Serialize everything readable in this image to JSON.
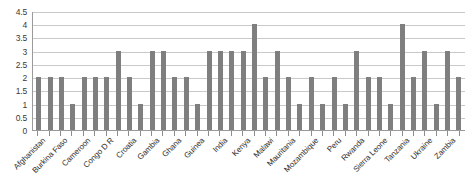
{
  "chart_data": {
    "type": "bar",
    "title": "",
    "subtitle": "",
    "xlabel": "",
    "ylabel": "",
    "ylim": [
      0,
      4.5
    ],
    "grid": true,
    "legend": false,
    "legend_position": "none",
    "bar_color": "#7f7f7f",
    "gridline_color": "#c9c9c9",
    "axis_color": "#9a9a9a",
    "y_ticks": [
      0,
      0.5,
      1,
      1.5,
      2,
      2.5,
      3,
      3.5,
      4,
      4.5
    ],
    "y_tick_labels": [
      "0",
      "0.5",
      "1",
      "1.5",
      "2",
      "2.5",
      "3",
      "3.5",
      "4",
      "4.5"
    ],
    "label_rotation_deg": -45,
    "note": "Category labels appear on alternating tick positions; 38 bars total.",
    "categories": [
      "Afghanistan",
      "",
      "Burkina Faso",
      "",
      "Cameroon",
      "",
      "Congo D R",
      "",
      "Croatia",
      "",
      "Gambia",
      "",
      "Ghana",
      "",
      "Guinea",
      "",
      "India",
      "",
      "Kenya",
      "",
      "Malawi",
      "",
      "Mauritania",
      "",
      "Mozambique",
      "",
      "Peru",
      "",
      "Rwanda",
      "",
      "Sierra Leone",
      "",
      "Tanzania",
      "",
      "Ukraine",
      "",
      "Zambia",
      ""
    ],
    "tick_labels": [
      "Afghanistan",
      "Burkina Faso",
      "Cameroon",
      "Congo D R",
      "Croatia",
      "Gambia",
      "Ghana",
      "Guinea",
      "India",
      "Kenya",
      "Malawi",
      "Mauritania",
      "Mozambique",
      "Peru",
      "Rwanda",
      "Sierra Leone",
      "Tanzania",
      "Ukraine",
      "Zambia"
    ],
    "values": [
      2,
      2,
      2,
      1,
      2,
      2,
      2,
      3,
      2,
      1,
      3,
      3,
      2,
      2,
      1,
      3,
      3,
      3,
      3,
      4,
      2,
      3,
      2,
      1,
      2,
      1,
      2,
      1,
      3,
      2,
      2,
      1,
      4,
      2,
      3,
      1,
      3,
      2
    ]
  }
}
